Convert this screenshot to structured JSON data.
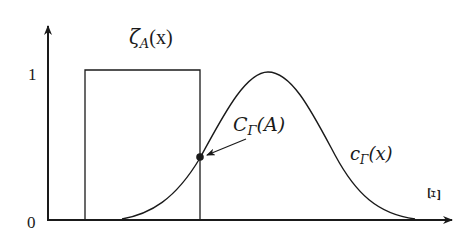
{
  "diagram": {
    "title": "",
    "axes": {
      "y_ticks": [
        {
          "label": "1",
          "value": 1
        },
        {
          "label": "0",
          "value": 0
        }
      ],
      "x_axis_label": "Ξ"
    },
    "labels": {
      "indicator": "ζ",
      "indicator_sub": "A",
      "indicator_arg": "(x)",
      "point": "C",
      "point_sub": "Γ",
      "point_arg": "(A)",
      "curve": "c",
      "curve_sub": "Γ",
      "curve_arg": "(x)"
    },
    "colors": {
      "stroke": "#1a1a1a",
      "background": "#ffffff"
    }
  }
}
